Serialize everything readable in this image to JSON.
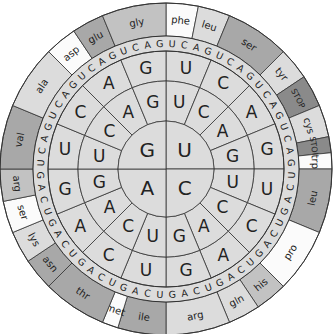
{
  "colors": {
    "light": "#dcdcdc",
    "white": "#fbfbfb",
    "mid": "#c2c2c2",
    "dark": "#a8a8a8",
    "stop": "#8a8a8a",
    "line": "#333333"
  },
  "center": {
    "x": 166,
    "y": 169
  },
  "radii": {
    "r1": 48,
    "r2": 88,
    "r3": 118,
    "r4": 133,
    "r5": 166
  },
  "first_base": [
    {
      "label": "U",
      "start": 0,
      "end": 90
    },
    {
      "label": "C",
      "start": 90,
      "end": 180
    },
    {
      "label": "A",
      "start": 180,
      "end": 270
    },
    {
      "label": "G",
      "start": 270,
      "end": 360
    }
  ],
  "second_bases": [
    "U",
    "C",
    "A",
    "G"
  ],
  "third_bases": [
    "U",
    "C",
    "A",
    "G"
  ],
  "amino_acids": [
    {
      "label": "phe",
      "from": 0,
      "count": 2,
      "shade": "white"
    },
    {
      "label": "leu",
      "from": 2,
      "count": 2,
      "shade": "light"
    },
    {
      "label": "ser",
      "from": 4,
      "count": 4,
      "shade": "dark"
    },
    {
      "label": "tyr",
      "from": 8,
      "count": 2,
      "shade": "light"
    },
    {
      "label": "STOP",
      "from": 10,
      "count": 2,
      "shade": "stop"
    },
    {
      "label": "cys",
      "from": 12,
      "count": 2,
      "shade": "light"
    },
    {
      "label": "STOP",
      "from": 14,
      "count": 1,
      "shade": "stop"
    },
    {
      "label": "trp",
      "from": 15,
      "count": 1,
      "shade": "white"
    },
    {
      "label": "leu",
      "from": 16,
      "count": 4,
      "shade": "dark"
    },
    {
      "label": "pro",
      "from": 20,
      "count": 4,
      "shade": "white"
    },
    {
      "label": "his",
      "from": 24,
      "count": 2,
      "shade": "mid"
    },
    {
      "label": "gln",
      "from": 26,
      "count": 2,
      "shade": "light"
    },
    {
      "label": "arg",
      "from": 28,
      "count": 4,
      "shade": "light"
    },
    {
      "label": "ile",
      "from": 32,
      "count": 3,
      "shade": "dark"
    },
    {
      "label": "met",
      "from": 35,
      "count": 1,
      "shade": "white"
    },
    {
      "label": "thr",
      "from": 36,
      "count": 4,
      "shade": "dark"
    },
    {
      "label": "asn",
      "from": 40,
      "count": 2,
      "shade": "dark"
    },
    {
      "label": "lys",
      "from": 42,
      "count": 2,
      "shade": "light"
    },
    {
      "label": "ser",
      "from": 44,
      "count": 2,
      "shade": "white"
    },
    {
      "label": "arg",
      "from": 46,
      "count": 2,
      "shade": "mid"
    },
    {
      "label": "val",
      "from": 48,
      "count": 4,
      "shade": "dark"
    },
    {
      "label": "ala",
      "from": 52,
      "count": 4,
      "shade": "light"
    },
    {
      "label": "asp",
      "from": 56,
      "count": 2,
      "shade": "white"
    },
    {
      "label": "glu",
      "from": 58,
      "count": 2,
      "shade": "dark"
    },
    {
      "label": "gly",
      "from": 60,
      "count": 4,
      "shade": "mid"
    }
  ]
}
